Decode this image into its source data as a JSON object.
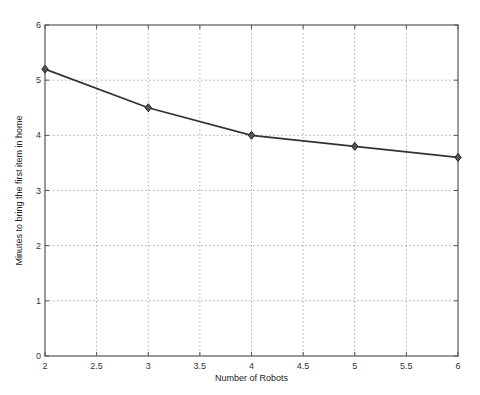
{
  "chart_data": {
    "type": "line",
    "title": "",
    "xlabel": "Number of Robots",
    "ylabel": "Minutes to bring the first item in home",
    "x": [
      2,
      3,
      4,
      5,
      6
    ],
    "series": [
      {
        "name": "Minutes to bring the first item in home",
        "values": [
          5.2,
          4.5,
          4.0,
          3.8,
          3.6
        ],
        "marker": "diamond",
        "color": "#333333"
      }
    ],
    "xlim": [
      2,
      6
    ],
    "ylim": [
      0,
      6
    ],
    "xticks": [
      "2",
      "2.5",
      "3",
      "3.5",
      "4",
      "4.5",
      "5",
      "5.5",
      "6"
    ],
    "yticks": [
      "0",
      "1",
      "2",
      "3",
      "4",
      "5",
      "6"
    ],
    "grid": true,
    "legend": null
  }
}
